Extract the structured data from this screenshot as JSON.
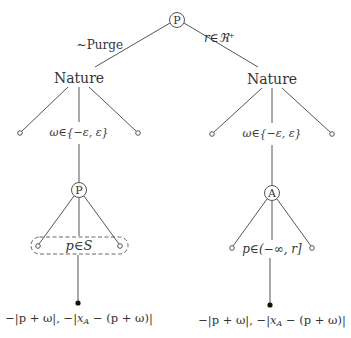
{
  "diagram": {
    "type": "game-tree",
    "root": {
      "label": "P",
      "edges": [
        {
          "label": "~Purge"
        },
        {
          "label": "r∈ℜ⁺"
        }
      ]
    },
    "left_branch": {
      "nature_label": "Nature",
      "nature_edge_label": "ω∈{−ε, ε}",
      "player_node": "P",
      "info_set_label": "p∈S",
      "payoff": "−|p + ω|, −|x_A − (p + ω)|",
      "payoff_parts": {
        "first": "−|p + ω|, −|",
        "x": "x",
        "sub": "A",
        "rest": " − (p + ω)|"
      }
    },
    "right_branch": {
      "nature_label": "Nature",
      "nature_edge_label": "ω∈{−ε, ε}",
      "player_node": "A",
      "choice_label": "p∈(−∞, r]",
      "payoff": "−|p + ω|, −|x_A − (p + ω)|",
      "payoff_parts": {
        "first": "−|p + ω|, −|",
        "x": "x",
        "sub": "A",
        "rest": " − (p + ω)|"
      }
    },
    "colors": {
      "line": "#555555",
      "text": "#333333",
      "background": "#ffffff"
    }
  }
}
